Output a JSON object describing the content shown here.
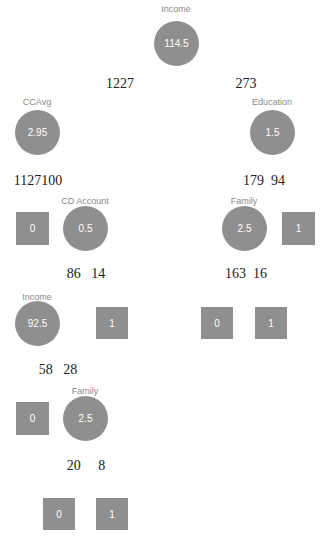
{
  "tree": {
    "root": {
      "feature": "Income",
      "threshold": "114.5"
    },
    "root_split_counts": {
      "left": "1227",
      "right": "273"
    },
    "level1": {
      "left": {
        "feature": "CCAvg",
        "threshold": "2.95"
      },
      "right": {
        "feature": "Education",
        "threshold": "1.5"
      }
    },
    "level1_counts": {
      "left": "1127100",
      "right": "179  94"
    },
    "level2": {
      "leaf_a": {
        "value": "0"
      },
      "cd_account": {
        "feature": "CD Account",
        "threshold": "0.5"
      },
      "family": {
        "feature": "Family",
        "threshold": "2.5"
      },
      "leaf_b": {
        "value": "1"
      }
    },
    "level2_counts": {
      "left": "86   14",
      "right": "163  16"
    },
    "level3": {
      "income": {
        "feature": "Income",
        "threshold": "92.5"
      },
      "leaf_c": {
        "value": "1"
      },
      "leaf_d": {
        "value": "0"
      },
      "leaf_e": {
        "value": "1"
      }
    },
    "level3_counts": {
      "left": "58   28"
    },
    "level4": {
      "leaf_f": {
        "value": "0"
      },
      "family": {
        "feature": "Family",
        "threshold": "2.5"
      }
    },
    "level4_counts": {
      "left": "20     8"
    },
    "level5": {
      "leaf_g": {
        "value": "0"
      },
      "leaf_h": {
        "value": "1"
      }
    }
  },
  "colors": {
    "node_fill": "#8f8f8f",
    "node_text": "#ffffff",
    "feature_label": "#8a8a8a",
    "count_text": "#222222"
  }
}
